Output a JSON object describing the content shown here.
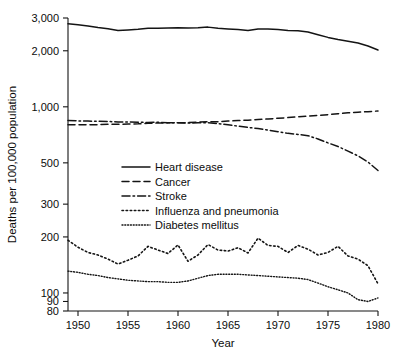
{
  "chart_data": {
    "type": "line",
    "title": "",
    "xlabel": "Year",
    "ylabel": "Deaths per 100,000 population",
    "yscale": "log",
    "ylim": [
      80,
      3000
    ],
    "xlim": [
      1949,
      1980
    ],
    "grid": false,
    "legend_position": "center-left",
    "xticks": [
      1950,
      1955,
      1960,
      1965,
      1970,
      1975,
      1980
    ],
    "xtick_labels": [
      "1950",
      "1955",
      "1960",
      "1965",
      "1970",
      "1975",
      "1980"
    ],
    "yticks": [
      80,
      90,
      100,
      200,
      300,
      500,
      1000,
      2000,
      3000
    ],
    "ytick_labels": [
      "80",
      "90",
      "100",
      "200",
      "300",
      "500",
      "1,000",
      "2,000",
      "3,000"
    ],
    "x": [
      1949,
      1950,
      1951,
      1952,
      1953,
      1954,
      1955,
      1956,
      1957,
      1958,
      1959,
      1960,
      1961,
      1962,
      1963,
      1964,
      1965,
      1966,
      1967,
      1968,
      1969,
      1970,
      1971,
      1972,
      1973,
      1974,
      1975,
      1976,
      1977,
      1978,
      1979,
      1980
    ],
    "series": [
      {
        "name": "Heart disease",
        "style": "solid",
        "values": [
          2790,
          2760,
          2720,
          2670,
          2630,
          2570,
          2590,
          2610,
          2640,
          2640,
          2650,
          2660,
          2650,
          2660,
          2680,
          2640,
          2620,
          2600,
          2570,
          2620,
          2620,
          2600,
          2570,
          2560,
          2520,
          2440,
          2360,
          2300,
          2250,
          2200,
          2120,
          2020
        ]
      },
      {
        "name": "Cancer",
        "style": "dashed",
        "values": [
          800,
          800,
          800,
          802,
          805,
          805,
          808,
          810,
          815,
          818,
          820,
          820,
          822,
          828,
          832,
          832,
          838,
          843,
          848,
          855,
          860,
          868,
          875,
          885,
          892,
          900,
          908,
          918,
          928,
          935,
          942,
          950
        ]
      },
      {
        "name": "Stroke",
        "style": "dash-dot",
        "values": [
          845,
          840,
          838,
          836,
          834,
          830,
          828,
          826,
          824,
          826,
          822,
          820,
          818,
          820,
          822,
          812,
          800,
          788,
          775,
          765,
          750,
          735,
          720,
          710,
          700,
          672,
          640,
          612,
          578,
          545,
          505,
          455
        ]
      },
      {
        "name": "Influenza and pneumonia",
        "style": "dotted",
        "values": [
          192,
          176,
          165,
          160,
          152,
          143,
          150,
          158,
          178,
          170,
          163,
          181,
          148,
          160,
          182,
          170,
          168,
          175,
          164,
          197,
          180,
          178,
          165,
          180,
          172,
          160,
          165,
          178,
          158,
          152,
          140,
          112
        ]
      },
      {
        "name": "Diabetes mellitus",
        "style": "fine-dotted",
        "values": [
          131,
          129,
          126,
          124,
          121,
          119,
          117,
          116,
          115,
          115,
          114,
          114,
          116,
          120,
          124,
          126,
          126,
          126,
          125,
          124,
          123,
          122,
          121,
          120,
          118,
          113,
          108,
          104,
          100,
          92,
          90,
          94
        ]
      }
    ]
  },
  "legend": {
    "items": [
      {
        "label": "Heart disease",
        "style": "solid"
      },
      {
        "label": "Cancer",
        "style": "dashed"
      },
      {
        "label": "Stroke",
        "style": "dash-dot"
      },
      {
        "label": "Influenza and pneumonia",
        "style": "dotted"
      },
      {
        "label": "Diabetes mellitus",
        "style": "fine-dotted"
      }
    ]
  },
  "colors": {
    "ink": "#141414",
    "background": "#ffffff"
  }
}
